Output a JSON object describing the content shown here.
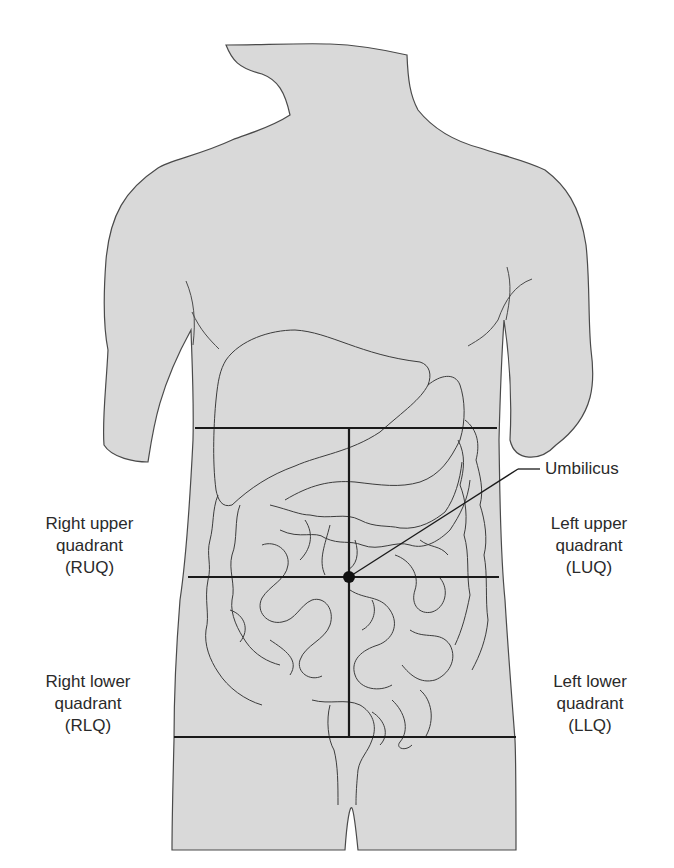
{
  "figure": {
    "landmark": {
      "label": "Umbilicus"
    },
    "quadrants": [
      {
        "id": "ruq",
        "line1": "Right upper",
        "line2": "quadrant",
        "abbr": "(RUQ)"
      },
      {
        "id": "luq",
        "line1": "Left upper",
        "line2": "quadrant",
        "abbr": "(LUQ)"
      },
      {
        "id": "rlq",
        "line1": "Right lower",
        "line2": "quadrant",
        "abbr": "(RLQ)"
      },
      {
        "id": "llq",
        "line1": "Left lower",
        "line2": "quadrant",
        "abbr": "(LLQ)"
      }
    ],
    "colors": {
      "body_fill": "#d9d9d9",
      "outline": "#4a4a4a",
      "organ_line": "#3c3c3c",
      "division_line": "#1a1a1a",
      "text": "#2a2a2a"
    }
  }
}
